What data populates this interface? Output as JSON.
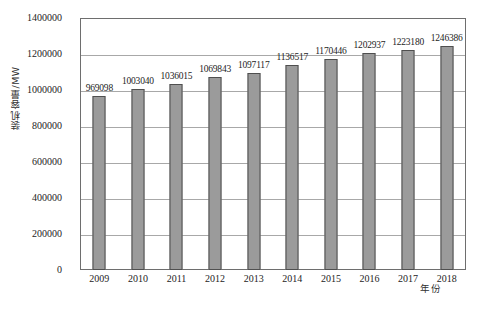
{
  "chart_data": {
    "type": "bar",
    "title": "",
    "xlabel": "年份",
    "ylabel": "装机容量/MW",
    "categories": [
      "2009",
      "2010",
      "2011",
      "2012",
      "2013",
      "2014",
      "2015",
      "2016",
      "2017",
      "2018"
    ],
    "values": [
      969098,
      1003040,
      1036015,
      1069843,
      1097117,
      1136517,
      1170446,
      1202937,
      1223180,
      1246386
    ],
    "data_labels": [
      "969098",
      "1003040",
      "1036015",
      "1069843",
      "1097117",
      "1136517",
      "1170446",
      "1202937",
      "1223180",
      "1246386"
    ],
    "ylim": [
      0,
      1400000
    ],
    "y_tick_step": 200000,
    "y_ticks": [
      0,
      200000,
      400000,
      600000,
      800000,
      1000000,
      1200000,
      1400000
    ],
    "y_tick_labels": [
      "0",
      "200000",
      "400000",
      "600000",
      "800000",
      "1000000",
      "1200000",
      "1400000"
    ],
    "grid": true,
    "grid_axis": "y",
    "legend": false,
    "legend_position": "none",
    "series": [
      {
        "name": "装机容量",
        "values": [
          969098,
          1003040,
          1036015,
          1069843,
          1097117,
          1136517,
          1170446,
          1202937,
          1223180,
          1246386
        ]
      }
    ],
    "colors": {
      "bar_fill": "#9b9b9b",
      "bar_border": "#4f4f4f",
      "gridline": "#a8a8a8",
      "frame": "#6e6e6e",
      "text": "#242424",
      "background": "#ffffff"
    }
  },
  "caption": "",
  "axes": {
    "y_title": "装机容量/MW",
    "x_title": "年份"
  }
}
